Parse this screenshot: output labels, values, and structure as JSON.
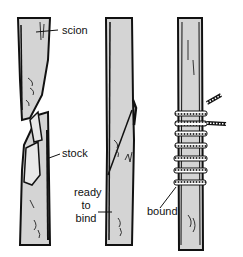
{
  "diagram": {
    "type": "grafting-illustration",
    "panels": [
      {
        "id": "separate",
        "labels": [
          "scion",
          "stock"
        ]
      },
      {
        "id": "joined",
        "labels": [
          "ready to bind"
        ]
      },
      {
        "id": "bound",
        "labels": [
          "bound"
        ]
      }
    ],
    "labels": {
      "scion": "scion",
      "stock": "stock",
      "ready_line1": "ready",
      "ready_line2": "to",
      "ready_line3": "bind",
      "bound": "bound"
    },
    "colors": {
      "wood": "#d4d4d4",
      "outline": "#111111",
      "background": "#ffffff"
    }
  }
}
